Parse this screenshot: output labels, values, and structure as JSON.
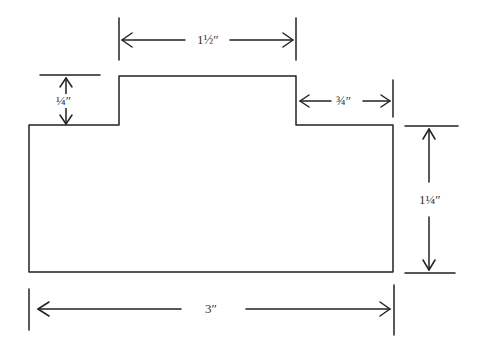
{
  "diagram": {
    "type": "dimensioned-part-outline",
    "units": "inches",
    "colors": {
      "stroke": "#222222",
      "background": "#ffffff",
      "text": "#333333"
    },
    "shape": {
      "description": "Rectangle with a raised tab on top",
      "base_width": "3\"",
      "base_height": "1¼\"",
      "tab_width": "1½\"",
      "tab_height": "¼\"",
      "tab_right_offset": "¾\""
    },
    "dimensions": {
      "tab_width": {
        "label": "1½″"
      },
      "tab_height": {
        "label": "¼″"
      },
      "tab_right_offset": {
        "label": "¾″"
      },
      "base_height": {
        "label": "1¼″"
      },
      "base_width": {
        "label": "3″"
      }
    }
  }
}
